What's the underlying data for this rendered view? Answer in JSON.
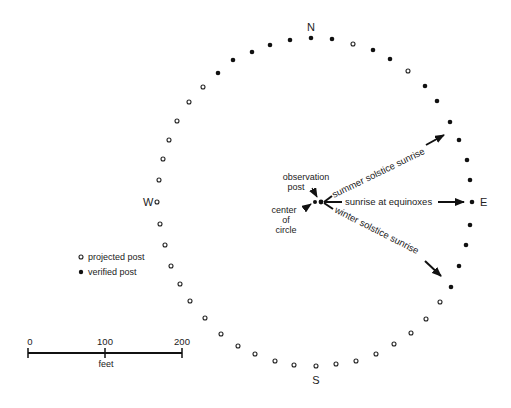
{
  "compass": {
    "north": "N",
    "south": "S",
    "east": "E",
    "west": "W"
  },
  "annotations": {
    "observation_post_line1": "observation",
    "observation_post_line2": "post",
    "center_line1": "center",
    "center_line2": "of",
    "center_line3": "circle",
    "summer": "summer solstice sunrise",
    "equinox": "sunrise at equinoxes",
    "winter": "winter solstice sunrise"
  },
  "legend": {
    "projected": "projected post",
    "verified": "verified post"
  },
  "scale": {
    "ticks": [
      "0",
      "100",
      "200"
    ],
    "unit": "feet"
  },
  "posts": [
    {
      "x": 311,
      "y": 38,
      "verified": true
    },
    {
      "x": 332,
      "y": 39,
      "verified": true
    },
    {
      "x": 353,
      "y": 44,
      "verified": false
    },
    {
      "x": 373,
      "y": 50,
      "verified": true
    },
    {
      "x": 390,
      "y": 59,
      "verified": true
    },
    {
      "x": 408,
      "y": 71,
      "verified": false
    },
    {
      "x": 425,
      "y": 86,
      "verified": true
    },
    {
      "x": 437,
      "y": 101,
      "verified": true
    },
    {
      "x": 450,
      "y": 122,
      "verified": true
    },
    {
      "x": 459,
      "y": 140,
      "verified": true
    },
    {
      "x": 467,
      "y": 160,
      "verified": true
    },
    {
      "x": 470,
      "y": 180,
      "verified": true
    },
    {
      "x": 472,
      "y": 202,
      "verified": true
    },
    {
      "x": 470,
      "y": 225,
      "verified": true
    },
    {
      "x": 466,
      "y": 245,
      "verified": true
    },
    {
      "x": 459,
      "y": 266,
      "verified": true
    },
    {
      "x": 451,
      "y": 287,
      "verified": true
    },
    {
      "x": 440,
      "y": 302,
      "verified": false
    },
    {
      "x": 426,
      "y": 319,
      "verified": false
    },
    {
      "x": 411,
      "y": 333,
      "verified": false
    },
    {
      "x": 394,
      "y": 344,
      "verified": false
    },
    {
      "x": 376,
      "y": 354,
      "verified": false
    },
    {
      "x": 356,
      "y": 361,
      "verified": false
    },
    {
      "x": 336,
      "y": 364,
      "verified": false
    },
    {
      "x": 316,
      "y": 366,
      "verified": false
    },
    {
      "x": 294,
      "y": 365,
      "verified": false
    },
    {
      "x": 275,
      "y": 361,
      "verified": false
    },
    {
      "x": 255,
      "y": 354,
      "verified": false
    },
    {
      "x": 238,
      "y": 346,
      "verified": false
    },
    {
      "x": 221,
      "y": 334,
      "verified": false
    },
    {
      "x": 205,
      "y": 318,
      "verified": false
    },
    {
      "x": 190,
      "y": 301,
      "verified": false
    },
    {
      "x": 180,
      "y": 284,
      "verified": false
    },
    {
      "x": 171,
      "y": 266,
      "verified": false
    },
    {
      "x": 165,
      "y": 245,
      "verified": false
    },
    {
      "x": 160,
      "y": 224,
      "verified": false
    },
    {
      "x": 157,
      "y": 202,
      "verified": false
    },
    {
      "x": 159,
      "y": 180,
      "verified": false
    },
    {
      "x": 163,
      "y": 159,
      "verified": false
    },
    {
      "x": 169,
      "y": 140,
      "verified": false
    },
    {
      "x": 177,
      "y": 121,
      "verified": false
    },
    {
      "x": 189,
      "y": 102,
      "verified": false
    },
    {
      "x": 203,
      "y": 87,
      "verified": false
    },
    {
      "x": 218,
      "y": 73,
      "verified": true
    },
    {
      "x": 233,
      "y": 60,
      "verified": true
    },
    {
      "x": 252,
      "y": 52,
      "verified": true
    },
    {
      "x": 270,
      "y": 45,
      "verified": true
    },
    {
      "x": 290,
      "y": 40,
      "verified": true
    }
  ]
}
